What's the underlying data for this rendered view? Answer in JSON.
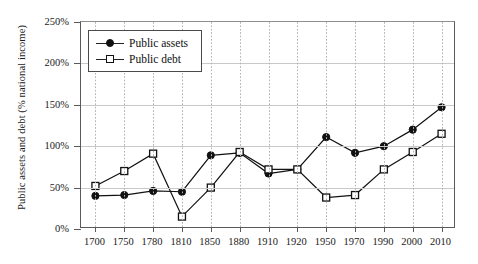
{
  "chart_data": {
    "type": "line",
    "title": "",
    "subtitle": "",
    "xlabel": "",
    "ylabel": "Public assets and debt (% national income)",
    "categories": [
      "1700",
      "1750",
      "1780",
      "1810",
      "1850",
      "1880",
      "1910",
      "1920",
      "1950",
      "1970",
      "1990",
      "2000",
      "2010"
    ],
    "x_tick_labels": [
      "1700",
      "1750",
      "1780",
      "1810",
      "1850",
      "1880",
      "1910",
      "1920",
      "1950",
      "1970",
      "1990",
      "2000",
      "2010"
    ],
    "y_tick_labels": [
      "0%",
      "50%",
      "100%",
      "150%",
      "200%",
      "250%"
    ],
    "y_tick_values": [
      0,
      50,
      100,
      150,
      200,
      250
    ],
    "ylim": [
      0,
      250
    ],
    "grid": {
      "horizontal": true,
      "vertical": true,
      "vertical_style": "dotted",
      "horizontal_style": "solid"
    },
    "legend": {
      "position": "top-left-inside",
      "entries": [
        "Public assets",
        "Public debt"
      ]
    },
    "series": [
      {
        "name": "Public assets",
        "marker": "filled-circle",
        "color": "#111111",
        "values": [
          40,
          41,
          46,
          45,
          89,
          92,
          67,
          72,
          111,
          92,
          100,
          120,
          147
        ]
      },
      {
        "name": "Public debt",
        "marker": "open-square",
        "color": "#111111",
        "values": [
          52,
          70,
          91,
          15,
          50,
          93,
          72,
          72,
          38,
          41,
          72,
          93,
          115
        ]
      }
    ]
  },
  "legend": {
    "items": [
      {
        "label": "Public assets",
        "marker": "filled-circle"
      },
      {
        "label": "Public debt",
        "marker": "open-square"
      }
    ]
  }
}
